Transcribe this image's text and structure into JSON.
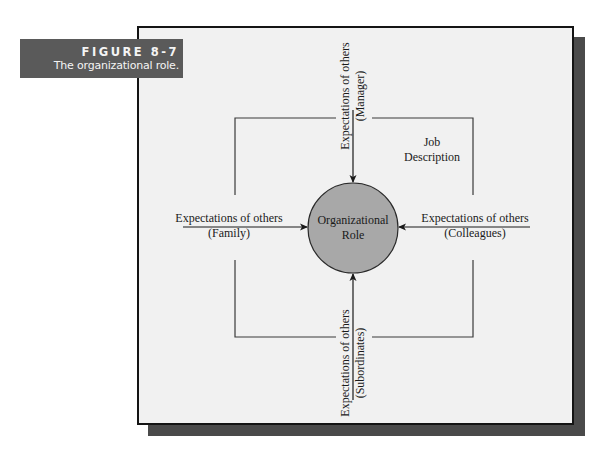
{
  "figure": {
    "number": "FIGURE 8-7",
    "caption": "The organizational role."
  },
  "diagram": {
    "center_node": {
      "line1": "Organizational",
      "line2": "Role",
      "fill": "#a8a8a8"
    },
    "boundary_label": {
      "line1": "Job",
      "line2": "Description"
    },
    "inputs": {
      "top": {
        "line1": "Expectations of others",
        "line2": "(Manager)"
      },
      "left": {
        "line1": "Expectations of others",
        "line2": "(Family)"
      },
      "right": {
        "line1": "Expectations of others",
        "line2": "(Colleagues)"
      },
      "bottom": {
        "line1": "Expectations of others",
        "line2": "(Subordinates)"
      }
    }
  },
  "colors": {
    "caption_bg": "#5a5a5a",
    "frame_bg": "#f1f1f1",
    "shadow": "#4a4a4a",
    "line": "#2a2a2a"
  }
}
